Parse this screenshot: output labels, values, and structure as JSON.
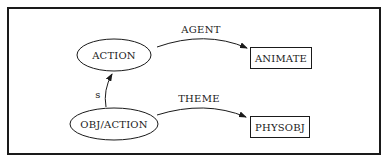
{
  "diagram": {
    "nodes": [
      {
        "id": "action",
        "label": "ACTION",
        "shape": "ellipse",
        "cx": 114,
        "cy": 55,
        "rx": 37,
        "ry": 16
      },
      {
        "id": "obj_action",
        "label": "OBJ/ACTION",
        "shape": "ellipse",
        "cx": 114,
        "cy": 124,
        "rx": 44,
        "ry": 16
      },
      {
        "id": "animate",
        "label": "ANIMATE",
        "shape": "box",
        "x": 250,
        "y": 47,
        "w": 61,
        "h": 21
      },
      {
        "id": "physobj",
        "label": "PHYSOBJ",
        "shape": "box",
        "x": 250,
        "y": 116,
        "w": 59,
        "h": 21
      }
    ],
    "edges": [
      {
        "from": "action",
        "to": "animate",
        "label": "AGENT"
      },
      {
        "from": "obj_action",
        "to": "physobj",
        "label": "THEME"
      },
      {
        "from": "obj_action",
        "to": "action",
        "label": "s"
      }
    ],
    "colors": {
      "stroke": "#1a1a1a",
      "background": "#ffffff"
    }
  }
}
